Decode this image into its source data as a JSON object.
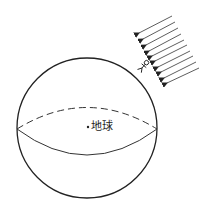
{
  "diagram": {
    "type": "earth-sunlight-illustration",
    "colors": {
      "stroke": "#222222",
      "background": "#ffffff"
    },
    "earth": {
      "label": "地球",
      "center": [
        87,
        128
      ],
      "radius": 70,
      "equator": {
        "front": "solid",
        "back": "dashed"
      }
    },
    "sunlight": {
      "icon": "parallel-arrows-icon",
      "count": 10,
      "direction": "down-left"
    },
    "observer": {
      "icon": "person-icon",
      "position": [
        142,
        66
      ]
    }
  }
}
